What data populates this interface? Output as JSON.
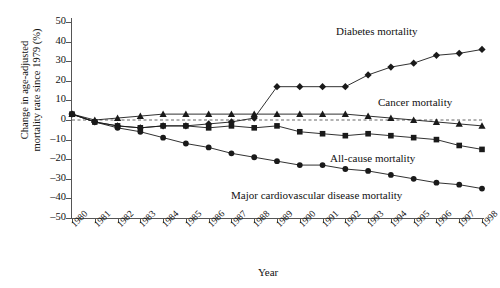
{
  "chart_data": {
    "type": "line",
    "title": "",
    "xlabel": "Year",
    "ylabel": "Change in age-adjusted mortality rate since 1979 (%)",
    "ylim": [
      -50,
      50
    ],
    "ytick_values": [
      50,
      40,
      30,
      20,
      10,
      0,
      -10,
      -20,
      -30,
      -40,
      -50
    ],
    "ytick_labels": [
      "50",
      "40",
      "30",
      "20",
      "10",
      "0",
      "–10",
      "–20",
      "–30",
      "–40",
      "–50"
    ],
    "grid": false,
    "zero_reference_line": true,
    "legend_position": "inline-annotations",
    "x": [
      1980,
      1981,
      1982,
      1983,
      1984,
      1985,
      1986,
      1987,
      1988,
      1989,
      1990,
      1991,
      1992,
      1993,
      1994,
      1995,
      1996,
      1997,
      1998
    ],
    "categories": [
      "1980",
      "1981",
      "1982",
      "1983",
      "1984",
      "1985",
      "1986",
      "1987",
      "1988",
      "1989",
      "1990",
      "1991",
      "1992",
      "1993",
      "1994",
      "1995",
      "1996",
      "1997",
      "1998"
    ],
    "series": [
      {
        "name": "Diabetes mortality",
        "marker": "diamond",
        "values": [
          3,
          -1,
          -3,
          -4,
          -3,
          -3,
          -2,
          -1,
          1,
          17,
          17,
          17,
          17,
          23,
          27,
          29,
          33,
          34,
          36
        ]
      },
      {
        "name": "Cancer mortality",
        "marker": "triangle",
        "values": [
          3,
          0,
          1,
          2,
          3,
          3,
          3,
          3,
          3,
          3,
          3,
          3,
          3,
          2,
          1,
          0,
          -1,
          -2,
          -3
        ]
      },
      {
        "name": "All-cause mortality",
        "marker": "square",
        "values": [
          3,
          -1,
          -3,
          -4,
          -3,
          -3,
          -4,
          -3,
          -4,
          -3,
          -6,
          -7,
          -8,
          -7,
          -8,
          -9,
          -10,
          -13,
          -15
        ]
      },
      {
        "name": "Major cardiovascular disease mortality",
        "marker": "circle",
        "values": [
          3,
          -1,
          -4,
          -6,
          -9,
          -12,
          -14,
          -17,
          -19,
          -21,
          -23,
          -23,
          -25,
          -26,
          -28,
          -30,
          -32,
          -33,
          -35
        ]
      }
    ]
  },
  "axis": {
    "x_title": "Year",
    "y_title_line1": "Change in age-adjusted",
    "y_title_line2": "mortality rate since 1979 (%)"
  },
  "annotations": {
    "diabetes": "Diabetes mortality",
    "cancer": "Cancer mortality",
    "allcause": "All-cause mortality",
    "cvd": "Major cardiovascular disease mortality"
  },
  "colors": {
    "line": "#1a1a1a",
    "axis": "#555555",
    "zero_line": "#666666",
    "background": "#ffffff"
  }
}
